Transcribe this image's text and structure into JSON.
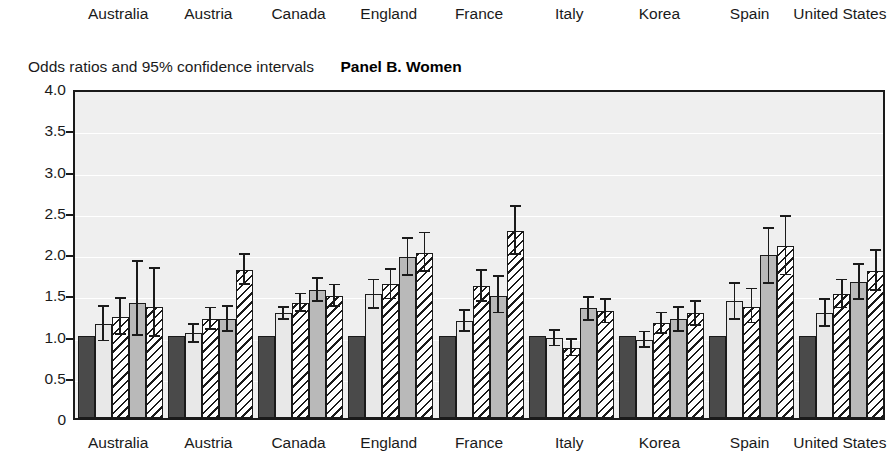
{
  "header": {
    "countries": [
      "Australia",
      "Austria",
      "Canada",
      "England",
      "France",
      "Italy",
      "Korea",
      "Spain",
      "United States"
    ]
  },
  "axis_title": "Odds ratios and 95% confidence intervals",
  "panel_title": "Panel B. Women",
  "chart_data": {
    "type": "bar",
    "title": "Panel B. Women",
    "subtitle": "Odds ratios and 95% confidence intervals",
    "xlabel": "",
    "ylabel": "Odds ratios and 95% confidence intervals",
    "ylim": [
      0,
      4.0
    ],
    "yticks": [
      "0",
      "0.5",
      "1.0",
      "1.5",
      "2.0",
      "2.5",
      "3.0",
      "3.5",
      "4.0"
    ],
    "ytick_values": [
      0,
      0.5,
      1.0,
      1.5,
      2.0,
      2.5,
      3.0,
      3.5,
      4.0
    ],
    "grid": true,
    "legend_position": "none",
    "categories": [
      "Australia",
      "Austria",
      "Canada",
      "England",
      "France",
      "Italy",
      "Korea",
      "Spain",
      "United States"
    ],
    "series": [
      {
        "name": "Model 1 (reference)",
        "fill": "dark",
        "values": [
          1.0,
          1.0,
          1.0,
          1.0,
          1.0,
          1.0,
          1.0,
          1.0,
          1.0
        ],
        "ci_lower": [
          null,
          null,
          null,
          null,
          null,
          null,
          null,
          null,
          null
        ],
        "ci_upper": [
          null,
          null,
          null,
          null,
          null,
          null,
          null,
          null,
          null
        ]
      },
      {
        "name": "Model 2",
        "fill": "light",
        "values": [
          1.14,
          1.03,
          1.27,
          1.5,
          1.18,
          0.97,
          0.95,
          1.42,
          1.27
        ],
        "ci_lower": [
          0.94,
          0.92,
          1.2,
          1.33,
          1.06,
          0.88,
          0.86,
          1.2,
          1.12
        ],
        "ci_upper": [
          1.36,
          1.14,
          1.35,
          1.68,
          1.31,
          1.07,
          1.05,
          1.64,
          1.44
        ]
      },
      {
        "name": "Model 3",
        "fill": "hatch",
        "values": [
          1.22,
          1.2,
          1.4,
          1.62,
          1.6,
          0.85,
          1.15,
          1.35,
          1.5
        ],
        "ci_lower": [
          1.02,
          1.08,
          1.3,
          1.45,
          1.42,
          0.76,
          1.03,
          1.16,
          1.34
        ],
        "ci_upper": [
          1.46,
          1.34,
          1.51,
          1.81,
          1.8,
          0.96,
          1.28,
          1.57,
          1.68
        ]
      },
      {
        "name": "Model 4",
        "fill": "mid",
        "values": [
          1.4,
          1.2,
          1.55,
          1.95,
          1.48,
          1.33,
          1.2,
          1.97,
          1.65
        ],
        "ci_lower": [
          1.01,
          1.06,
          1.42,
          1.73,
          1.28,
          1.19,
          1.06,
          1.64,
          1.44
        ],
        "ci_upper": [
          1.9,
          1.36,
          1.7,
          2.18,
          1.72,
          1.47,
          1.35,
          2.3,
          1.87
        ]
      },
      {
        "name": "Model 5",
        "fill": "hatch",
        "values": [
          1.35,
          1.8,
          1.48,
          2.0,
          2.27,
          1.3,
          1.27,
          2.08,
          1.78
        ],
        "ci_lower": [
          1.0,
          1.63,
          1.36,
          1.78,
          1.99,
          1.16,
          1.13,
          1.74,
          1.55
        ],
        "ci_upper": [
          1.82,
          1.99,
          1.62,
          2.25,
          2.57,
          1.44,
          1.42,
          2.45,
          2.04
        ]
      }
    ]
  }
}
